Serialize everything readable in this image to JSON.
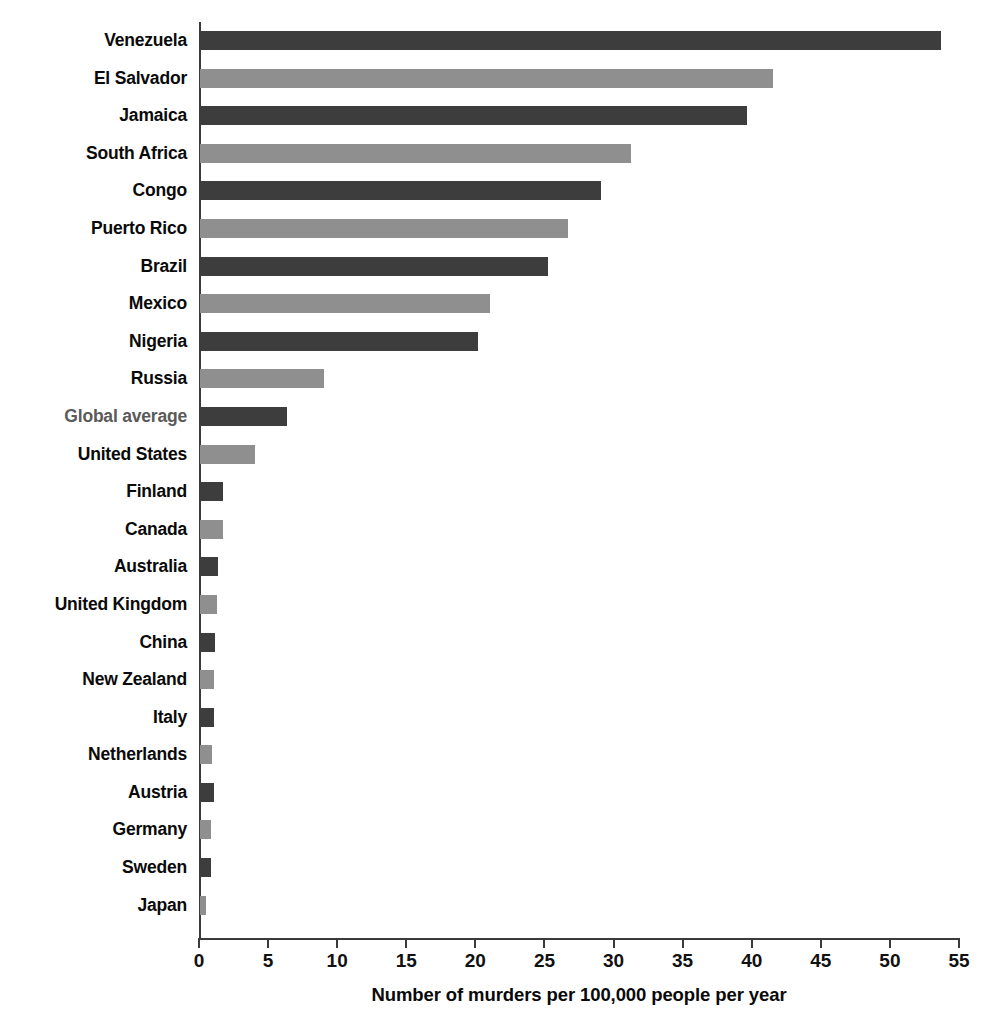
{
  "chart_data": {
    "type": "bar",
    "orientation": "horizontal",
    "title": "",
    "xlabel": "Number of murders per 100,000 people per year",
    "ylabel": "",
    "xlim": [
      0,
      55
    ],
    "xticks": [
      0,
      5,
      10,
      15,
      20,
      25,
      30,
      35,
      40,
      45,
      50,
      55
    ],
    "grid": false,
    "legend": null,
    "colors": {
      "bar_dark": "#3d3d3d",
      "bar_light": "#8f8f8f",
      "axis": "#3a3a3a",
      "label": "#0a0a0a",
      "highlight_label": "#5a5a5a",
      "background": "#ffffff"
    },
    "categories": [
      "Venezuela",
      "El Salvador",
      "Jamaica",
      "South Africa",
      "Congo",
      "Puerto Rico",
      "Brazil",
      "Mexico",
      "Nigeria",
      "Russia",
      "Global average",
      "United States",
      "Finland",
      "Canada",
      "Australia",
      "United Kingdom",
      "China",
      "New Zealand",
      "Italy",
      "Netherlands",
      "Austria",
      "Germany",
      "Sweden",
      "Japan"
    ],
    "values": [
      53.6,
      41.5,
      39.6,
      31.2,
      29.0,
      26.6,
      25.2,
      21.0,
      20.1,
      9.0,
      6.3,
      4.0,
      1.7,
      1.7,
      1.3,
      1.2,
      1.1,
      1.0,
      1.0,
      0.9,
      1.0,
      0.8,
      0.8,
      0.4
    ],
    "bar_shades": [
      "dark",
      "light",
      "dark",
      "light",
      "dark",
      "light",
      "dark",
      "light",
      "dark",
      "light",
      "dark",
      "light",
      "dark",
      "light",
      "dark",
      "light",
      "dark",
      "light",
      "dark",
      "light",
      "dark",
      "light",
      "dark",
      "light"
    ],
    "highlight_category": "Global average"
  }
}
